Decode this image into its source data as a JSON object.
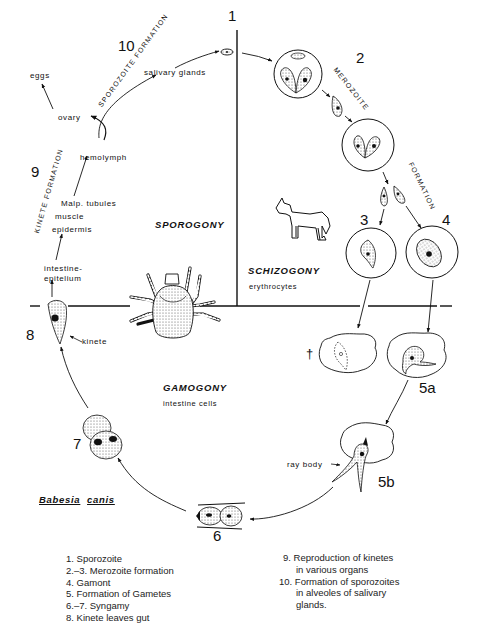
{
  "diagram": {
    "organism": {
      "genus": "Babesia",
      "species": "canis"
    },
    "phases": {
      "sporogony": "SPOROGONY",
      "schizogony": "SCHIZOGONY",
      "schizogony_site": "erythrocytes",
      "gamogony": "GAMOGONY",
      "gamogony_site": "intestine cells"
    },
    "stage_numbers": {
      "s1": "1",
      "s2": "2",
      "s3": "3",
      "s4": "4",
      "s5a": "5a",
      "s5b": "5b",
      "s6": "6",
      "s7": "7",
      "s8": "8",
      "s9": "9",
      "s10": "10"
    },
    "arc_labels": {
      "merozoite": "MEROZOITE",
      "formation_right": "FORMATION",
      "sporozoite_formation": "SPOROZOITE FORMATION",
      "kinete_formation": "KINETE FORMATION"
    },
    "tick_path_labels": {
      "eggs": "eggs",
      "ovary": "ovary",
      "salivary_glands": "salivary glands",
      "hemolymph": "hemolymph",
      "malp_tubules": "Malp. tubules",
      "muscle": "muscle",
      "epidermis": "epidermis",
      "intestine_line1": "intestine-",
      "intestine_line2": "epitelium"
    },
    "annotations": {
      "kinete": "kinete",
      "ray_body": "ray body",
      "dead_marker": "†"
    },
    "hosts": {
      "vertebrate": "dog-illustration",
      "vector": "tick-illustration"
    },
    "colors": {
      "ink": "#111111",
      "background": "#ffffff",
      "stipple": "#cfcfcf"
    }
  },
  "legend": {
    "left": [
      "1. Sporozoite",
      "2.–3. Merozoite formation",
      "4. Gamont",
      "5. Formation of Gametes",
      "6.–7. Syngamy",
      "8. Kinete leaves gut"
    ],
    "right": [
      "9. Reproduction of kinetes",
      "in various organs",
      "10. Formation of sporozoites",
      "in alveoles of salivary",
      "glands."
    ]
  }
}
